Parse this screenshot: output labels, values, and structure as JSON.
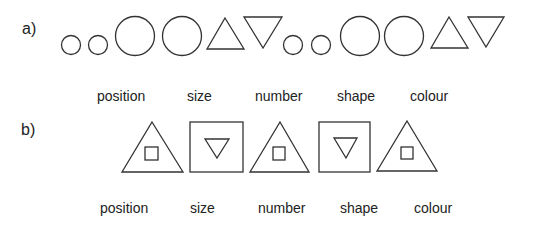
{
  "part_a": {
    "label": "a)",
    "sequence": [
      {
        "shape": "circle",
        "size": "small"
      },
      {
        "shape": "circle",
        "size": "small"
      },
      {
        "shape": "circle",
        "size": "large"
      },
      {
        "shape": "circle",
        "size": "large"
      },
      {
        "shape": "triangle-up",
        "size": "large"
      },
      {
        "shape": "triangle-down",
        "size": "large"
      },
      {
        "shape": "circle",
        "size": "small"
      },
      {
        "shape": "circle",
        "size": "small"
      },
      {
        "shape": "circle",
        "size": "large"
      },
      {
        "shape": "circle",
        "size": "large"
      },
      {
        "shape": "triangle-up",
        "size": "large"
      },
      {
        "shape": "triangle-down",
        "size": "large"
      }
    ],
    "options": [
      "position",
      "size",
      "number",
      "shape",
      "colour"
    ]
  },
  "part_b": {
    "label": "b)",
    "sequence": [
      {
        "outer": "triangle-up",
        "inner": "square"
      },
      {
        "outer": "square",
        "inner": "triangle-down"
      },
      {
        "outer": "triangle-up",
        "inner": "square"
      },
      {
        "outer": "square",
        "inner": "triangle-down"
      },
      {
        "outer": "triangle-up",
        "inner": "square"
      }
    ],
    "options": [
      "position",
      "size",
      "number",
      "shape",
      "colour"
    ]
  },
  "colors": {
    "stroke": "#333333",
    "text": "#222222",
    "background": "#ffffff"
  }
}
